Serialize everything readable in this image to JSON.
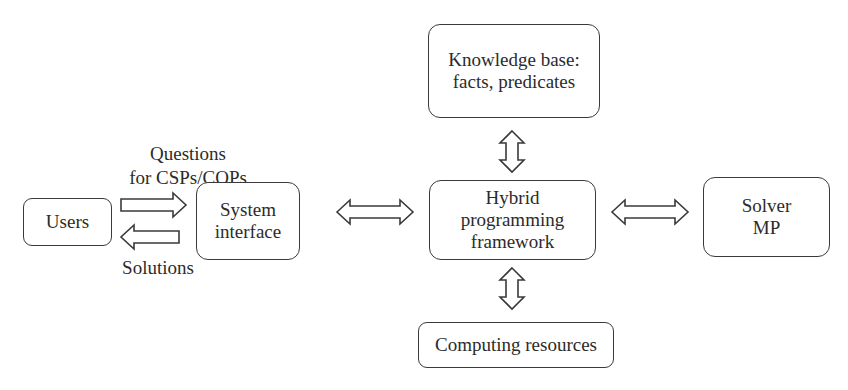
{
  "diagram": {
    "nodes": {
      "users": {
        "label": "Users"
      },
      "system_interface": {
        "line1": "System",
        "line2": "interface"
      },
      "hybrid": {
        "line1": "Hybrid",
        "line2": "programming",
        "line3": "framework"
      },
      "knowledge_base": {
        "line1": "Knowledge base:",
        "line2": "facts, predicates"
      },
      "solver": {
        "line1": "Solver",
        "line2": "MP"
      },
      "computing": {
        "label": "Computing resources"
      }
    },
    "edge_labels": {
      "questions_line1": "Questions",
      "questions_line2": "for CSPs/COPs",
      "solutions": "Solutions"
    },
    "edges": [
      {
        "from": "users",
        "to": "system_interface",
        "type": "single-arrow",
        "label": "Questions for CSPs/COPs"
      },
      {
        "from": "system_interface",
        "to": "users",
        "type": "single-arrow",
        "label": "Solutions"
      },
      {
        "from": "system_interface",
        "to": "hybrid",
        "type": "double-arrow"
      },
      {
        "from": "hybrid",
        "to": "knowledge_base",
        "type": "double-arrow"
      },
      {
        "from": "hybrid",
        "to": "solver",
        "type": "double-arrow"
      },
      {
        "from": "hybrid",
        "to": "computing",
        "type": "double-arrow"
      }
    ],
    "colors": {
      "stroke": "#3a3a3a",
      "text": "#2b2b2b",
      "background": "#ffffff"
    }
  }
}
